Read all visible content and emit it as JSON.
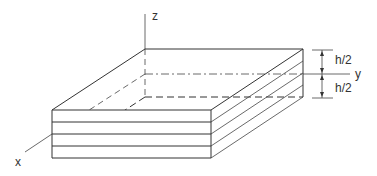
{
  "diagram": {
    "type": "laminated-plate-coordinate-system",
    "axes": {
      "x_label": "x",
      "y_label": "y",
      "z_label": "z"
    },
    "dimensions": {
      "upper_half_label": "h/2",
      "lower_half_label": "h/2"
    },
    "layers": 4,
    "colors": {
      "line": "#333333",
      "background": "#ffffff"
    }
  }
}
